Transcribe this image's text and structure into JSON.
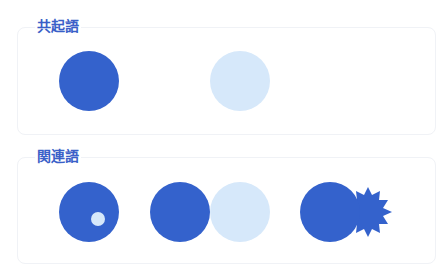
{
  "sections": [
    {
      "title": "共起語",
      "description": "co-occurring words: two separate circles (dark and light)"
    },
    {
      "title": "関連語",
      "description": "related words: circle containing small circle, two adjacent circles, circle with starburst"
    }
  ],
  "colors": {
    "primary": "#3462cc",
    "light": "#d6e8fa",
    "label": "#3a5fc8",
    "panel_border": "#f0f2f6"
  }
}
